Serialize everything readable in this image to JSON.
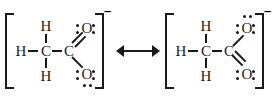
{
  "diagram": {
    "background_color": "#ffffff",
    "ink_color": "#1a1a1a",
    "arrow": {
      "symbol": "resonance-double-headed-arrow",
      "label": "↔"
    }
  },
  "structures": [
    {
      "id": "left",
      "charge_label": "–",
      "bracket_left": "[",
      "bracket_right": "]",
      "atoms": {
        "h_left": "H",
        "h_top": "H",
        "h_bottom": "H",
        "c_methyl": "C",
        "c_carboxyl": "C",
        "o_top": "O",
        "o_bottom": "O"
      },
      "bonds": {
        "h_left_to_c": "single",
        "h_top_to_c": "single",
        "h_bottom_to_c": "single",
        "c_to_c": "single",
        "c_to_o_top": "double",
        "c_to_o_bottom": "single"
      },
      "lone_pairs": {
        "o_top": 2,
        "o_bottom": 3
      }
    },
    {
      "id": "right",
      "charge_label": "–",
      "bracket_left": "[",
      "bracket_right": "]",
      "atoms": {
        "h_left": "H",
        "h_top": "H",
        "h_bottom": "H",
        "c_methyl": "C",
        "c_carboxyl": "C",
        "o_top": "O",
        "o_bottom": "O"
      },
      "bonds": {
        "h_left_to_c": "single",
        "h_top_to_c": "single",
        "h_bottom_to_c": "single",
        "c_to_c": "single",
        "c_to_o_top": "single",
        "c_to_o_bottom": "double"
      },
      "lone_pairs": {
        "o_top": 3,
        "o_bottom": 2
      }
    }
  ]
}
